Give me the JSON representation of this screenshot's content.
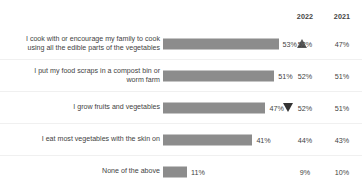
{
  "header": {
    "columns": [
      {
        "label": "2022"
      },
      {
        "label": "2021"
      }
    ]
  },
  "chart_data": {
    "type": "bar",
    "title": "",
    "subtitle": "",
    "xlabel": "",
    "ylabel": "",
    "orientation": "horizontal",
    "grid": false,
    "legend": "none",
    "xlim": [
      0,
      100
    ],
    "value_suffix": "%",
    "bar_color": "#8c8c8c",
    "categories": [
      "I cook with or encourage my family to cook using all the edible parts of the vegetables",
      "I put my food scraps in a compost bin or worm farm",
      "I grow fruits and vegetables",
      "I eat most vegetables with the skin on",
      "None of the above"
    ],
    "values": [
      53,
      51,
      47,
      41,
      11
    ],
    "series": [
      {
        "name": "2023",
        "values": [
          53,
          51,
          47,
          41,
          11
        ]
      },
      {
        "name": "2022",
        "values": [
          52,
          52,
          52,
          44,
          9
        ]
      },
      {
        "name": "2021",
        "values": [
          47,
          51,
          51,
          43,
          10
        ]
      }
    ]
  },
  "rows": [
    {
      "label_line1": "I cook with or encourage my family to cook",
      "label_line2": "using all the edible parts of the vegetables",
      "bar_value": "53%",
      "bar_pct": 53,
      "y2022": "52%",
      "y2021": "47%",
      "trend": "up"
    },
    {
      "label_line1": "I put my food scraps in a compost bin or",
      "label_line2": "worm farm",
      "bar_value": "51%",
      "bar_pct": 51,
      "y2022": "52%",
      "y2021": "51%",
      "trend": "none"
    },
    {
      "label_line1": "I grow fruits and vegetables",
      "label_line2": "",
      "bar_value": "47%",
      "bar_pct": 47,
      "y2022": "52%",
      "y2021": "51%",
      "trend": "down"
    },
    {
      "label_line1": "I eat most vegetables with the skin on",
      "label_line2": "",
      "bar_value": "41%",
      "bar_pct": 41,
      "y2022": "44%",
      "y2021": "43%",
      "trend": "none"
    },
    {
      "label_line1": "None of the above",
      "label_line2": "",
      "bar_value": "11%",
      "bar_pct": 11,
      "y2022": "9%",
      "y2021": "10%",
      "trend": "none"
    }
  ]
}
